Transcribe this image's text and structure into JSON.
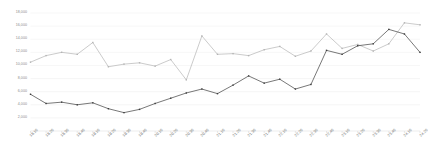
{
  "chart_data": {
    "type": "line",
    "title": "",
    "subtitle": "",
    "xlabel": "",
    "ylabel": "",
    "grid": true,
    "legend": "none",
    "ylim": [
      0,
      18000
    ],
    "yticks": [
      2000,
      4000,
      6000,
      8000,
      10000,
      12000,
      14000,
      16000,
      18000
    ],
    "ytick_labels": [
      "2,000",
      "4,000",
      "6,000",
      "8,000",
      "10,000",
      "12,000",
      "14,000",
      "16,000",
      "18,000"
    ],
    "categories": [
      "18.16",
      "18.26",
      "18.36",
      "18.46",
      "19.16",
      "19.26",
      "19.36",
      "19.46",
      "20.16",
      "20.26",
      "20.36",
      "20.46",
      "21.16",
      "21.26",
      "21.36",
      "21.46",
      "22.16",
      "22.26",
      "22.36",
      "22.46",
      "23.16",
      "23.26",
      "23.36",
      "23.46",
      "24.16",
      "24.26"
    ],
    "series": [
      {
        "name": "series-light",
        "color": "#b4b4b4",
        "values": [
          10500,
          11500,
          12000,
          11700,
          13500,
          9800,
          10200,
          10400,
          9900,
          10900,
          7800,
          14500,
          11700,
          11800,
          11500,
          12400,
          12900,
          11400,
          12200,
          14800,
          12600,
          13200,
          12200,
          13300,
          16500,
          16200
        ]
      },
      {
        "name": "series-dark",
        "color": "#3d3d3d",
        "values": [
          5600,
          4200,
          4400,
          4000,
          4300,
          3400,
          2800,
          3300,
          4200,
          5000,
          5800,
          6400,
          5700,
          7000,
          8400,
          7300,
          7900,
          6400,
          7100,
          12300,
          11700,
          13000,
          13300,
          15500,
          14800,
          12000
        ]
      }
    ]
  },
  "axis": {
    "x_axis_name": "category-axis",
    "y_axis_name": "value-axis"
  }
}
